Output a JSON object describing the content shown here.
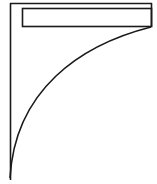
{
  "diagram": {
    "stroke_color": "#1a1a1a",
    "background_color": "#ffffff",
    "outer_left_edge": {
      "x": 10,
      "y1": 3,
      "y2": 180
    },
    "outer_top_edge": {
      "y": 3,
      "x1": 10,
      "x2": 152
    },
    "shelf_rect": {
      "x": 22,
      "y": 8,
      "width": 129,
      "height": 18
    },
    "right_edge": {
      "x": 152,
      "y1": 3,
      "y2": 27
    },
    "curve": {
      "start": [
        151,
        27
      ],
      "control": [
        30,
        60
      ],
      "end": [
        10,
        178
      ]
    }
  }
}
